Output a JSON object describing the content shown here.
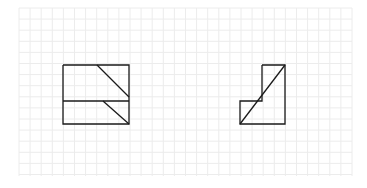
{
  "diagram": {
    "background": "#ffffff",
    "grid": {
      "x0": 19,
      "x1": 352,
      "y0": 8,
      "y1": 176,
      "spacing": 11.1,
      "color": "#ececec"
    },
    "stroke": "#1a1a1a",
    "stroke_width": 1.3,
    "figures": [
      {
        "name": "left-figure",
        "polylines": [
          [
            [
              63,
              65
            ],
            [
              129,
              65
            ],
            [
              129,
              124
            ],
            [
              63,
              124
            ],
            [
              63,
              65
            ]
          ],
          [
            [
              63,
              101
            ],
            [
              129,
              101
            ]
          ],
          [
            [
              97,
              65
            ],
            [
              129,
              97
            ]
          ],
          [
            [
              103,
              101
            ],
            [
              129,
              124
            ]
          ]
        ]
      },
      {
        "name": "right-figure",
        "polylines": [
          [
            [
              262,
              65
            ],
            [
              285,
              65
            ],
            [
              285,
              124
            ],
            [
              240,
              124
            ],
            [
              240,
              101
            ],
            [
              262,
              101
            ],
            [
              262,
              65
            ]
          ],
          [
            [
              240,
              124
            ],
            [
              285,
              65
            ]
          ]
        ]
      }
    ]
  }
}
